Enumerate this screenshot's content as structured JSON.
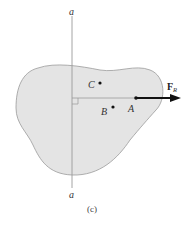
{
  "figure": {
    "axis_label_top": "a",
    "axis_label_bottom": "a",
    "points": [
      {
        "name": "C",
        "label": "C"
      },
      {
        "name": "B",
        "label": "B"
      },
      {
        "name": "A",
        "label": "A"
      }
    ],
    "force": {
      "symbol": "F",
      "subscript": "R"
    },
    "subfigure_label": "(c)",
    "colors": {
      "body_fill": "#e4e4e4",
      "body_stroke": "#9a9a9a",
      "axis_line": "#9a9a9a",
      "arrow": "#111111"
    }
  }
}
